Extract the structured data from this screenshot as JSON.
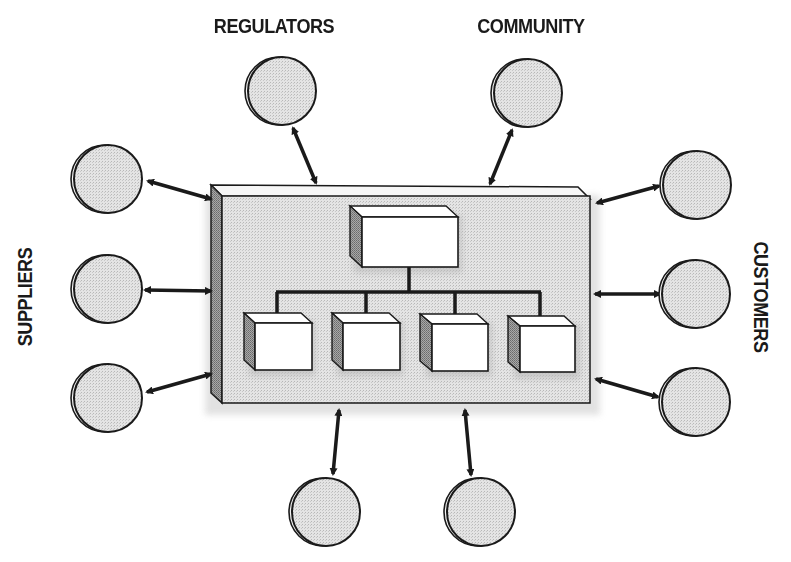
{
  "diagram": {
    "labels": {
      "regulators": "REGULATORS",
      "community": "COMMUNITY",
      "suppliers": "SUPPLIERS",
      "customers": "CUSTOMERS"
    },
    "colors": {
      "stroke": "#1a1a1a",
      "circle_fill": "#dcdcdc",
      "box_fill": "#e9e9e9",
      "side_fill": "#9a9a9a",
      "node_fill": "#ffffff"
    },
    "stakeholder_groups": [
      {
        "name": "regulators",
        "count": 1,
        "position": "top-left"
      },
      {
        "name": "community",
        "count": 1,
        "position": "top-right"
      },
      {
        "name": "suppliers",
        "count": 3,
        "position": "left"
      },
      {
        "name": "customers",
        "count": 3,
        "position": "right"
      },
      {
        "name": "unlabeled-bottom",
        "count": 2,
        "position": "bottom"
      }
    ],
    "organization": {
      "top_node_count": 1,
      "child_node_count": 4
    }
  }
}
